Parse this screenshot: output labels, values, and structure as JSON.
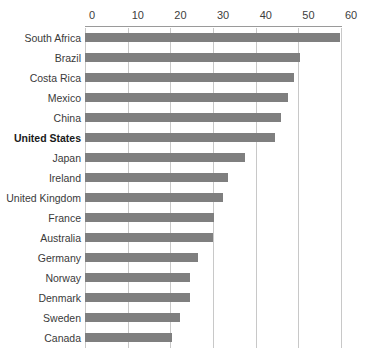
{
  "chart_data": {
    "type": "bar",
    "orientation": "horizontal",
    "title": "",
    "subtitle": "",
    "xlabel": "",
    "ylabel": "",
    "xlim": [
      0,
      60
    ],
    "ylim": null,
    "grid": true,
    "grid_axis": "x",
    "legend": false,
    "legend_position": "none",
    "axis_position": "top",
    "tick_labels": [
      "0",
      "10",
      "20",
      "30",
      "40",
      "50",
      "60"
    ],
    "ticks": [
      0,
      10,
      20,
      30,
      40,
      50,
      60
    ],
    "categories": [
      "South Africa",
      "Brazil",
      "Costa Rica",
      "Mexico",
      "China",
      "United States",
      "Japan",
      "Ireland",
      "United Kingdom",
      "France",
      "Australia",
      "Germany",
      "Norway",
      "Denmark",
      "Sweden",
      "Canada"
    ],
    "values": [
      59.8,
      50.5,
      49.0,
      47.5,
      46.0,
      44.5,
      37.5,
      33.5,
      32.3,
      30.2,
      30.0,
      26.5,
      24.5,
      24.5,
      22.2,
      20.5
    ],
    "highlighted_category": "United States",
    "bar_color": "#7f7f7f",
    "grid_color": "#c8c8c8",
    "text_color": "#3a3a3a"
  }
}
